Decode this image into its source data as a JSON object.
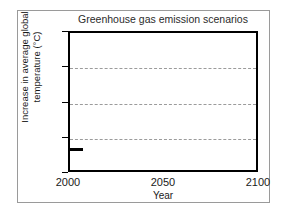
{
  "chart_data": {
    "type": "line",
    "title": "Greenhouse gas emission scenarios",
    "xlabel": "Year",
    "ylabel": "Increase in average global temperature (°C)",
    "ylabel_line1": "Increase in average global",
    "ylabel_line2": "temperature (°C)",
    "xlim": [
      2000,
      2100
    ],
    "ylim": [
      1,
      5
    ],
    "x_ticks": [
      2000,
      2050,
      2100
    ],
    "x_tick_labels": [
      "2000",
      "2050",
      "2100"
    ],
    "y_ticks": [
      1,
      2,
      3,
      4,
      5
    ],
    "y_tick_labels": [
      "1",
      "2",
      "3",
      "4",
      "5"
    ],
    "gridlines": {
      "horizontal_at": [
        2,
        3,
        4
      ],
      "style": "dashed",
      "color": "#9b9b9b",
      "vertical": false
    },
    "legend": null,
    "series": [
      {
        "name": "emission scenario baseline",
        "color": "#000000",
        "x": [
          2000,
          2007
        ],
        "values": [
          1.7,
          1.7
        ]
      }
    ],
    "axis_color": "#000000",
    "background": "#ffffff",
    "frame_color": "#9a9a9a"
  }
}
